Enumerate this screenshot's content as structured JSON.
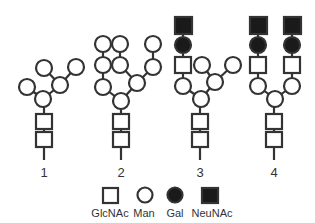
{
  "figure": {
    "structures": [
      {
        "label": "1"
      },
      {
        "label": "2"
      },
      {
        "label": "3"
      },
      {
        "label": "4"
      }
    ],
    "legend": [
      {
        "symbol": "white-square",
        "label": "GlcNAc"
      },
      {
        "symbol": "white-circle",
        "label": "Man"
      },
      {
        "symbol": "black-circle",
        "label": "Gal"
      },
      {
        "symbol": "black-square",
        "label": "NeuNAc"
      }
    ],
    "colors": {
      "stroke": "#333333",
      "fill_light": "#ffffff",
      "fill_dark": "#1a1a1a"
    }
  }
}
